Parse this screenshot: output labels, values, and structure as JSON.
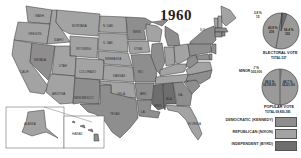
{
  "title": "1960",
  "states": [
    {
      "abbr": "WASH.",
      "ev": "9",
      "party": "r"
    },
    {
      "abbr": "OREGON",
      "ev": "6",
      "party": "r"
    },
    {
      "abbr": "CALIF.",
      "ev": "32",
      "party": "r"
    },
    {
      "abbr": "IDAHO",
      "ev": "4",
      "party": "r"
    },
    {
      "abbr": "NEVADA",
      "ev": "3",
      "party": "d"
    },
    {
      "abbr": "MONTANA",
      "ev": "4",
      "party": "r"
    },
    {
      "abbr": "WYOMING",
      "ev": "3",
      "party": "r"
    },
    {
      "abbr": "UTAH",
      "ev": "4",
      "party": "r"
    },
    {
      "abbr": "ARIZONA",
      "ev": "4",
      "party": "r"
    },
    {
      "abbr": "COLORADO",
      "ev": "6",
      "party": "r"
    },
    {
      "abbr": "NEW MEXICO",
      "ev": "4",
      "party": "d"
    },
    {
      "abbr": "N. DAK.",
      "ev": "4",
      "party": "r"
    },
    {
      "abbr": "S. DAK.",
      "ev": "4",
      "party": "r"
    },
    {
      "abbr": "NEBRASKA",
      "ev": "6",
      "party": "r"
    },
    {
      "abbr": "KANSAS",
      "ev": "8",
      "party": "r"
    },
    {
      "abbr": "OKLA.",
      "ev": "7 1",
      "party": "r"
    },
    {
      "abbr": "TEXAS",
      "ev": "24",
      "party": "d"
    },
    {
      "abbr": "MINN.",
      "ev": "11",
      "party": "d"
    },
    {
      "abbr": "IOWA",
      "ev": "10",
      "party": "r"
    },
    {
      "abbr": "MO.",
      "ev": "13",
      "party": "d"
    },
    {
      "abbr": "ARK.",
      "ev": "8",
      "party": "d"
    },
    {
      "abbr": "LA.",
      "ev": "10",
      "party": "d"
    },
    {
      "abbr": "WIS.",
      "ev": "12",
      "party": "r"
    },
    {
      "abbr": "ILL.",
      "ev": "27",
      "party": "d"
    },
    {
      "abbr": "MICH.",
      "ev": "20",
      "party": "d"
    },
    {
      "abbr": "IND.",
      "ev": "13",
      "party": "r"
    },
    {
      "abbr": "OHIO",
      "ev": "25",
      "party": "r"
    },
    {
      "abbr": "KY.",
      "ev": "10",
      "party": "r"
    },
    {
      "abbr": "TENN.",
      "ev": "11",
      "party": "r"
    },
    {
      "abbr": "MISS.",
      "ev": "8",
      "party": "i"
    },
    {
      "abbr": "ALA.",
      "ev": "5 6",
      "party": "i"
    },
    {
      "abbr": "GA.",
      "ev": "12",
      "party": "d"
    },
    {
      "abbr": "FLORIDA",
      "ev": "10",
      "party": "r"
    },
    {
      "abbr": "S.C.",
      "ev": "8",
      "party": "d"
    },
    {
      "abbr": "N.C.",
      "ev": "14",
      "party": "d"
    },
    {
      "abbr": "VA.",
      "ev": "12",
      "party": "r"
    },
    {
      "abbr": "W.VA.",
      "ev": "8",
      "party": "d"
    },
    {
      "abbr": "PA.",
      "ev": "32",
      "party": "d"
    },
    {
      "abbr": "N.Y.",
      "ev": "45",
      "party": "d"
    },
    {
      "abbr": "VT.",
      "ev": "3",
      "party": "r"
    },
    {
      "abbr": "N.H.",
      "ev": "4",
      "party": "r"
    },
    {
      "abbr": "ME.",
      "ev": "5",
      "party": "r"
    },
    {
      "abbr": "MASS.",
      "ev": "16",
      "party": "d"
    },
    {
      "abbr": "R.I.",
      "ev": "4",
      "party": "d"
    },
    {
      "abbr": "CONN.",
      "ev": "8",
      "party": "d"
    },
    {
      "abbr": "N.J.",
      "ev": "16",
      "party": "d"
    },
    {
      "abbr": "DEL.",
      "ev": "3",
      "party": "d"
    },
    {
      "abbr": "MD.",
      "ev": "9",
      "party": "d"
    },
    {
      "abbr": "ALASKA",
      "ev": "3",
      "party": "r"
    },
    {
      "abbr": "HAWAII",
      "ev": "3",
      "party": "d"
    }
  ],
  "electoral_pie": {
    "title": "ELECTORAL VOTE",
    "total_label": "TOTAL 537",
    "minor_label": "2.8 %",
    "minor_votes": "15",
    "dem_label": "56.4 %",
    "dem_votes": "303",
    "rep_label": "40.8 %",
    "rep_votes": "219"
  },
  "popular_pie": {
    "title": "POPULAR VOTE",
    "total_label": "TOTAL 68,836,385",
    "minor_caption": "MINOR",
    "minor_label": ".7 %",
    "minor_votes": "503,000",
    "dem_label": "49.7 %",
    "dem_votes": "34,221,000",
    "rep_label": "49.5 %",
    "rep_votes": "34,108,000"
  },
  "legend": [
    {
      "label": "DEMOCRATIC (KENNEDY)",
      "color": "#8e8e8e"
    },
    {
      "label": "REPUBLICAN (NIXON)",
      "color": "#a3a3a3"
    },
    {
      "label": "INDEPENDENT (BYRD)",
      "color": "#6e6e6e"
    }
  ],
  "colors": {
    "democratic": "#8e8e8e",
    "republican": "#a3a3a3",
    "independent": "#6e6e6e",
    "background": "#ffffff"
  }
}
